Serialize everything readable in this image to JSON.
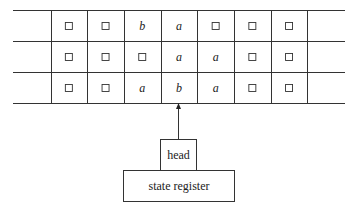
{
  "diagram": {
    "blank_symbol": "□",
    "tape_rows": [
      [
        "□",
        "□",
        "b",
        "a",
        "□",
        "□",
        "□"
      ],
      [
        "□",
        "□",
        "□",
        "a",
        "a",
        "□",
        "□"
      ],
      [
        "□",
        "□",
        "a",
        "b",
        "a",
        "□",
        "□"
      ]
    ],
    "head_position_index": 3,
    "head": {
      "label": "head"
    },
    "state_register": {
      "label": "state register"
    }
  }
}
